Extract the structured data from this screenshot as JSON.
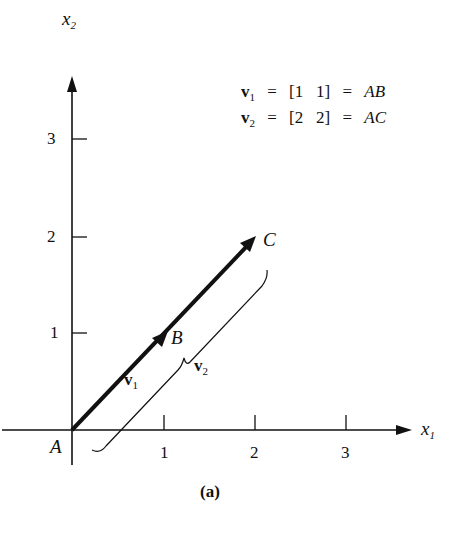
{
  "figure": {
    "caption": "(a)",
    "axes": {
      "x_label": "x",
      "x_label_sub": "1",
      "y_label": "x",
      "y_label_sub": "2",
      "x_ticks": [
        "1",
        "2",
        "3"
      ],
      "y_ticks": [
        "1",
        "2",
        "3"
      ]
    },
    "points": {
      "origin": "A",
      "b": "B",
      "c": "C"
    },
    "vectors": {
      "v1_label": "v",
      "v1_sub": "1",
      "v2_label": "v",
      "v2_sub": "2"
    },
    "equations": [
      {
        "vec": "v",
        "sub": "1",
        "eq1": "=",
        "matrix": "[1   1]",
        "eq2": "=",
        "result": "AB"
      },
      {
        "vec": "v",
        "sub": "2",
        "eq1": "=",
        "matrix": "[2   2]",
        "eq2": "=",
        "result": "AC"
      }
    ],
    "colors": {
      "ink": "#111111",
      "background": "#ffffff"
    }
  }
}
